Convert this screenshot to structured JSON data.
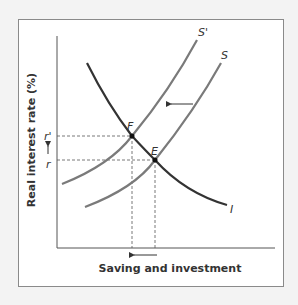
{
  "diagram": {
    "x_axis_label": "Saving and investment",
    "y_axis_label": "Real interest rate (%)",
    "curves": [
      {
        "name": "S'",
        "label": "S'",
        "type": "saving-supply-shifted",
        "color": "#7a7a7a"
      },
      {
        "name": "S",
        "label": "S",
        "type": "saving-supply",
        "color": "#7a7a7a"
      },
      {
        "name": "I",
        "label": "I",
        "type": "investment-demand",
        "color": "#333333"
      }
    ],
    "points": [
      {
        "label": "F",
        "description": "new equilibrium"
      },
      {
        "label": "E",
        "description": "original equilibrium"
      }
    ],
    "y_ticks": [
      {
        "label": "r'"
      },
      {
        "label": "r"
      }
    ],
    "arrows": [
      {
        "description": "supply shift left",
        "direction": "left"
      },
      {
        "description": "interest rate rises",
        "direction": "up"
      },
      {
        "description": "quantity decreases",
        "direction": "left"
      }
    ]
  }
}
